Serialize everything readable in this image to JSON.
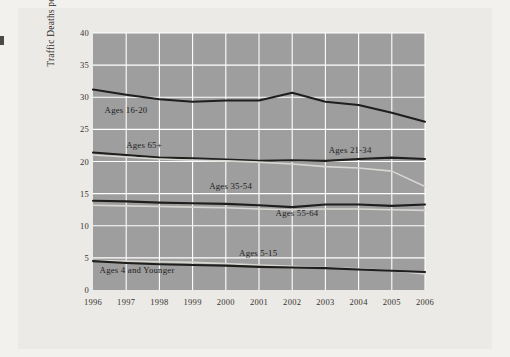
{
  "figure": {
    "background_color": "#eceae6",
    "plot_background_color": "#9e9e9e",
    "gridline_color": "#ffffff",
    "dark_series_color": "#1f1e1d",
    "light_series_color": "#d8d6d2"
  },
  "chart_data": {
    "type": "line",
    "title": "",
    "xlabel": "",
    "ylabel": "Traffic Deaths per 100,000 Population",
    "x": [
      1996,
      1997,
      1998,
      1999,
      2000,
      2001,
      2002,
      2003,
      2004,
      2005,
      2006
    ],
    "xticklabels": [
      "1996",
      "1997",
      "1998",
      "1999",
      "2000",
      "2001",
      "2002",
      "2003",
      "2004",
      "2005",
      "2006"
    ],
    "yticklabels": [
      "0",
      "5",
      "10",
      "15",
      "20",
      "25",
      "30",
      "35",
      "40"
    ],
    "yticks": [
      0,
      5,
      10,
      15,
      20,
      25,
      30,
      35,
      40
    ],
    "ylim": [
      0,
      40
    ],
    "xlim": [
      1996,
      2006
    ],
    "grid": true,
    "legend": "inline-labels",
    "series": [
      {
        "name": "Ages 16-20",
        "style": "dark",
        "label_x": 1996.35,
        "label_y": 27.8,
        "values": [
          31.2,
          30.4,
          29.7,
          29.3,
          29.5,
          29.5,
          30.7,
          29.3,
          28.8,
          27.6,
          26.2
        ]
      },
      {
        "name": "Ages 21-34",
        "style": "dark",
        "label_x": 2003.1,
        "label_y": 21.6,
        "values": [
          21.4,
          21.0,
          20.6,
          20.5,
          20.3,
          20.1,
          20.2,
          20.1,
          20.4,
          20.6,
          20.4
        ]
      },
      {
        "name": "Ages 65+",
        "style": "light",
        "label_x": 1997.0,
        "label_y": 22.4,
        "values": [
          21.0,
          20.7,
          20.4,
          20.2,
          20.1,
          19.9,
          19.6,
          19.2,
          19.0,
          18.5,
          16.1
        ]
      },
      {
        "name": "Ages 35-54",
        "style": "dark",
        "label_x": 1999.5,
        "label_y": 16.0,
        "values": [
          13.9,
          13.8,
          13.6,
          13.5,
          13.4,
          13.2,
          12.9,
          13.3,
          13.3,
          13.1,
          13.3
        ]
      },
      {
        "name": "Ages 55-64",
        "style": "light",
        "label_x": 2001.5,
        "label_y": 11.9,
        "values": [
          13.2,
          13.1,
          13.0,
          12.9,
          12.8,
          12.6,
          12.5,
          12.6,
          12.6,
          12.5,
          12.4
        ]
      },
      {
        "name": "Ages 5-15",
        "style": "light",
        "label_x": 2000.4,
        "label_y": 5.6,
        "values": [
          4.6,
          4.5,
          4.4,
          4.3,
          4.1,
          3.9,
          3.7,
          3.5,
          3.3,
          3.0,
          2.5
        ]
      },
      {
        "name": "Ages 4 and Younger",
        "style": "dark",
        "label_x": 1996.2,
        "label_y": 3.0,
        "values": [
          4.5,
          4.2,
          4.0,
          3.9,
          3.8,
          3.6,
          3.5,
          3.4,
          3.2,
          3.0,
          2.8
        ]
      }
    ]
  }
}
